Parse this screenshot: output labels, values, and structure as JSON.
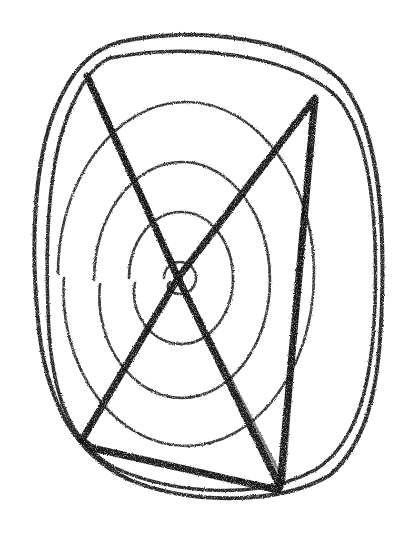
{
  "image": {
    "description": "Hand-drawn crayon sketch of concentric irregular loops (spiral-like target) overlaid with a bold zig-zag line forming an X and a triangle",
    "medium": "black crayon on white paper",
    "ink_color": "#111111",
    "background_color": "#ffffff"
  },
  "elements": {
    "outer_loops_count": 2,
    "inner_rings_count": 4,
    "center_dot": true,
    "zigzag_line": true
  }
}
